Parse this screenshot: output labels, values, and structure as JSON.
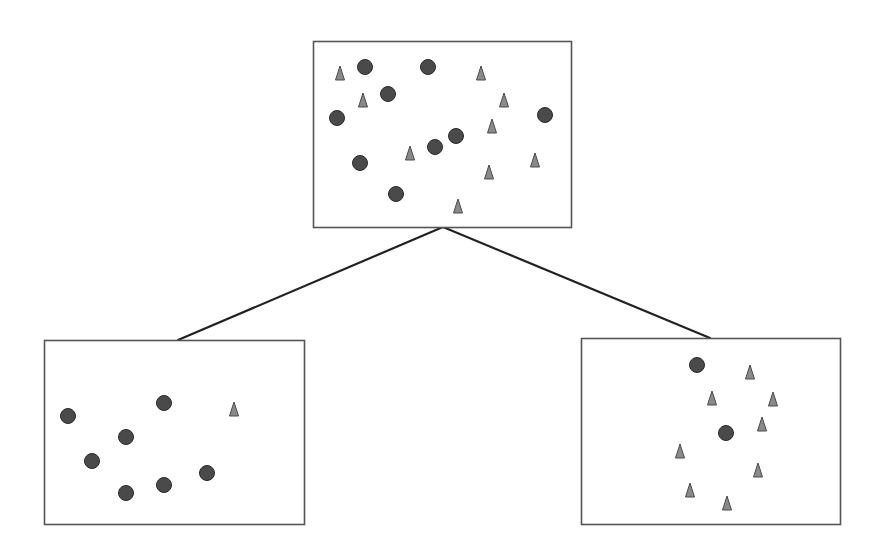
{
  "diagram": {
    "type": "tree-split",
    "colors": {
      "background": "#ffffff",
      "box_border": "#555555",
      "edge": "#222222",
      "circle_fill": "#4a4a4a",
      "circle_stroke": "#2a2a2a",
      "triangle_fill": "#8a8a8a",
      "triangle_stroke": "#4a4a4a"
    },
    "nodes": [
      {
        "id": "parent",
        "box": {
          "x": 313,
          "y": 41,
          "w": 258,
          "h": 186
        },
        "circles": [
          [
            365,
            67
          ],
          [
            428,
            67
          ],
          [
            388,
            94
          ],
          [
            337,
            118
          ],
          [
            545,
            115
          ],
          [
            456,
            136
          ],
          [
            435,
            147
          ],
          [
            360,
            163
          ],
          [
            396,
            194
          ]
        ],
        "triangles": [
          [
            340,
            73
          ],
          [
            363,
            100
          ],
          [
            481,
            73
          ],
          [
            504,
            100
          ],
          [
            492,
            126
          ],
          [
            410,
            153
          ],
          [
            535,
            160
          ],
          [
            489,
            172
          ],
          [
            458,
            206
          ]
        ]
      },
      {
        "id": "left-child",
        "box": {
          "x": 44,
          "y": 340,
          "w": 260,
          "h": 184
        },
        "circles": [
          [
            68,
            416
          ],
          [
            164,
            403
          ],
          [
            126,
            437
          ],
          [
            92,
            461
          ],
          [
            207,
            473
          ],
          [
            164,
            485
          ],
          [
            126,
            493
          ]
        ],
        "triangles": [
          [
            234,
            409
          ]
        ]
      },
      {
        "id": "right-child",
        "box": {
          "x": 581,
          "y": 338,
          "w": 259,
          "h": 186
        },
        "circles": [
          [
            697,
            365
          ],
          [
            726,
            433
          ]
        ],
        "triangles": [
          [
            750,
            372
          ],
          [
            712,
            398
          ],
          [
            773,
            399
          ],
          [
            762,
            424
          ],
          [
            680,
            451
          ],
          [
            758,
            470
          ],
          [
            690,
            490
          ],
          [
            727,
            503
          ]
        ]
      }
    ],
    "edges": [
      {
        "from": "parent",
        "to": "left-child",
        "x1": 443,
        "y1": 227,
        "x2": 178,
        "y2": 340
      },
      {
        "from": "parent",
        "to": "right-child",
        "x1": 443,
        "y1": 227,
        "x2": 710,
        "y2": 338
      }
    ],
    "shape_sizes": {
      "circle_radius": 7.5,
      "triangle_w": 9,
      "triangle_h": 14
    }
  }
}
